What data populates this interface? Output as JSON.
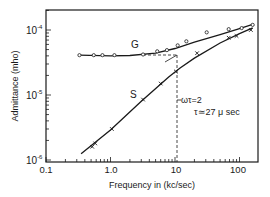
{
  "chart_data": {
    "type": "line",
    "title": "",
    "xlabel": "Frequency in (kc/sec)",
    "ylabel": "Admittance (mho)",
    "xscale": "log",
    "yscale": "log",
    "xlim": [
      0.1,
      200
    ],
    "ylim": [
      1e-06,
      0.0002
    ],
    "x_tick_labels": [
      "0.1",
      "1.0",
      "10",
      "100"
    ],
    "x_ticks": [
      0.1,
      1.0,
      10,
      100
    ],
    "y_tick_labels": [
      "10-4",
      "10-5",
      "10-6"
    ],
    "y_ticks": [
      0.0001,
      1e-05,
      1e-06
    ],
    "grid": false,
    "legend": "inline labels",
    "series": [
      {
        "name": "G",
        "marker": "circle",
        "x": [
          0.33,
          0.55,
          0.75,
          1.15,
          3.2,
          5.3,
          7.5,
          11,
          15,
          31,
          68,
          108,
          160
        ],
        "y": [
          4.1e-05,
          4.1e-05,
          4.1e-05,
          4.1e-05,
          4.2e-05,
          4.7e-05,
          4.9e-05,
          5.8e-05,
          6.7e-05,
          9.2e-05,
          0.000103,
          0.000107,
          0.00012
        ],
        "curve_x": [
          0.33,
          1,
          2,
          5,
          10,
          20,
          50,
          100,
          160
        ],
        "curve_y": [
          4.1e-05,
          4e-05,
          4.05e-05,
          4.4e-05,
          5.2e-05,
          6.5e-05,
          8.5e-05,
          0.000105,
          0.000122
        ]
      },
      {
        "name": "S",
        "marker": "x",
        "x": [
          0.52,
          0.58,
          1.05,
          3.2,
          6.0,
          10.3,
          22,
          68,
          90,
          150
        ],
        "y": [
          1.6e-06,
          1.8e-06,
          3e-06,
          8.5e-06,
          1.5e-05,
          2.3e-05,
          4.4e-05,
          7.6e-05,
          8.1e-05,
          0.0001
        ],
        "curve_x": [
          0.35,
          1,
          3,
          8,
          12,
          20,
          50,
          100,
          160
        ],
        "curve_y": [
          1.25e-06,
          2.9e-06,
          8e-06,
          1.9e-05,
          2.6e-05,
          3.7e-05,
          6.3e-05,
          8.8e-05,
          0.000108
        ]
      }
    ],
    "annotations": [
      {
        "text": "G",
        "near": "G curve, ~4 kc/sec"
      },
      {
        "text": "S",
        "near": "S curve, ~3 kc/sec"
      },
      {
        "text": "ωτ = 2",
        "note": "dashed vertical line at ~11.8 kc/sec"
      },
      {
        "text": "τ ≃ 27 μ sec"
      }
    ],
    "reference_lines": [
      {
        "type": "vertical-dashed",
        "x": 11.8,
        "y_from": 1e-06,
        "y_to": 4.1e-05
      },
      {
        "type": "horizontal-dashed",
        "y": 4.1e-05,
        "x_from": 6,
        "x_to": 11.8
      }
    ]
  },
  "labels": {
    "xlabel": "Frequency in (kc/sec)",
    "ylabel": "Admittance (mho)",
    "x_ticks": [
      "0.1",
      "1.0",
      "10",
      "100"
    ],
    "y_base": "10",
    "y_exp": [
      "-4",
      "-5",
      "-6"
    ],
    "series_g": "G",
    "series_s": "S",
    "annot_omega": "ωτ=2",
    "annot_tau": "τ≃27 μ sec"
  }
}
